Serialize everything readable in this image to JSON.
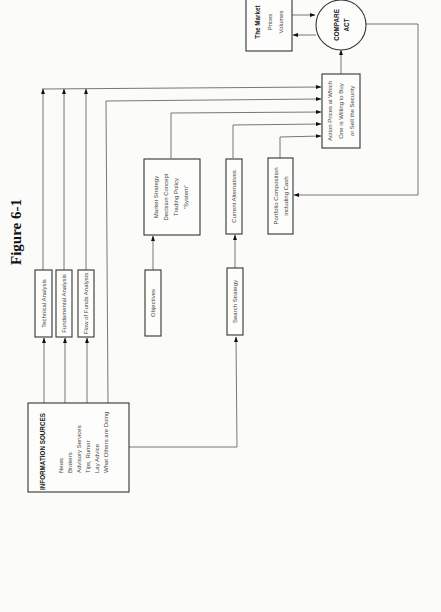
{
  "figure": {
    "title": "Figure 6-1"
  },
  "nodes": {
    "info_sources": {
      "heading": "INFORMATION SOURCES",
      "items": [
        "News",
        "Brokers",
        "Advisory Services",
        "Tips, Rumor",
        "Lay Advice",
        "What Others are Doing"
      ]
    },
    "technical_analysis": {
      "label": "Technical Analysis"
    },
    "fundamental_analysis": {
      "label": "Fundamental Analysis"
    },
    "flow_of_funds": {
      "label": "Flow of Funds Analysis"
    },
    "objectives": {
      "label": "Objectives"
    },
    "market_strategy": {
      "lines": [
        "Market Strategy",
        "Decision Concept",
        "Trading Policy",
        "\"System\""
      ]
    },
    "search_strategy": {
      "label": "Search Strategy"
    },
    "current_alternatives": {
      "label": "Current Alternatives"
    },
    "portfolio_composition": {
      "lines": [
        "Portfolio Composition",
        "including Cash"
      ]
    },
    "action_prices": {
      "lines": [
        "Action Prices at Which",
        "One is Willing to Buy",
        "or Sell the Security"
      ]
    },
    "the_market": {
      "lines": [
        "The Market",
        "Prices",
        "Volumes"
      ]
    },
    "compare_act": {
      "lines": [
        "COMPARE",
        "ACT"
      ]
    }
  },
  "edges": [
    {
      "from": "info_sources",
      "to": "technical_analysis"
    },
    {
      "from": "info_sources",
      "to": "fundamental_analysis"
    },
    {
      "from": "info_sources",
      "to": "flow_of_funds"
    },
    {
      "from": "info_sources",
      "to": "action_prices"
    },
    {
      "from": "info_sources",
      "to": "search_strategy"
    },
    {
      "from": "technical_analysis",
      "to": "action_prices"
    },
    {
      "from": "fundamental_analysis",
      "to": "action_prices"
    },
    {
      "from": "flow_of_funds",
      "to": "action_prices"
    },
    {
      "from": "objectives",
      "to": "market_strategy"
    },
    {
      "from": "market_strategy",
      "to": "action_prices"
    },
    {
      "from": "search_strategy",
      "to": "current_alternatives"
    },
    {
      "from": "current_alternatives",
      "to": "action_prices"
    },
    {
      "from": "portfolio_composition",
      "to": "action_prices"
    },
    {
      "from": "action_prices",
      "to": "compare_act"
    },
    {
      "from": "the_market",
      "to": "compare_act"
    },
    {
      "from": "compare_act",
      "to": "the_market"
    },
    {
      "from": "compare_act",
      "to": "portfolio_composition"
    }
  ]
}
